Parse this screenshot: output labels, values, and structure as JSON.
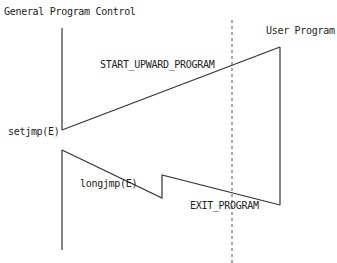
{
  "diagram": {
    "labels": {
      "general_program_control": "General Program Control",
      "user_program": "User Program",
      "start_upward_program": "START_UPWARD_PROGRAM",
      "setjmp": "setjmp(E)",
      "longjmp": "longjmp(E)",
      "exit_program": "EXIT_PROGRAM"
    },
    "colors": {
      "line": "#333333",
      "text": "#222222",
      "dashed": "#555555"
    }
  }
}
